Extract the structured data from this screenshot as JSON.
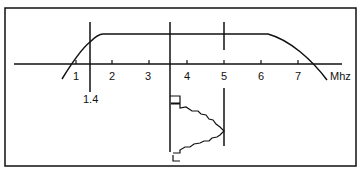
{
  "diagram": {
    "axis_unit": "Mhz",
    "ticks": [
      {
        "label": "1",
        "x": 76
      },
      {
        "label": "2",
        "x": 112
      },
      {
        "label": "3",
        "x": 149
      },
      {
        "label": "4",
        "x": 187
      },
      {
        "label": "5",
        "x": 224
      },
      {
        "label": "6",
        "x": 261
      },
      {
        "label": "7",
        "x": 298
      }
    ],
    "marker_label": "1.4"
  }
}
